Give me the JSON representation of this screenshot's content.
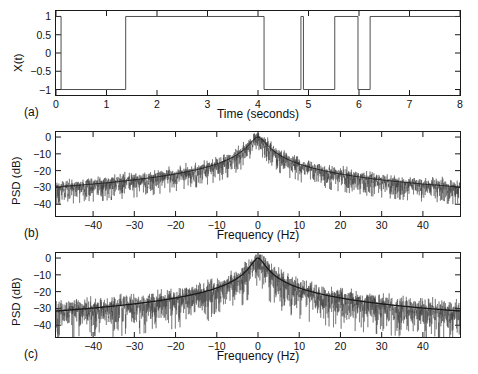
{
  "figure": {
    "width": 478,
    "height": 374,
    "background": "#ffffff",
    "line_color": "#1a1a1a",
    "trace_color": "#3a3a3a"
  },
  "chart_data": [
    {
      "type": "line",
      "panel_label": "(a)",
      "title": "",
      "xlabel": "Time (seconds)",
      "ylabel": "X(t)",
      "xlim": [
        0,
        8
      ],
      "ylim": [
        -1.15,
        1.15
      ],
      "xticks": [
        0,
        1,
        2,
        3,
        4,
        5,
        6,
        7,
        8
      ],
      "xticklabels": [
        "0",
        "1",
        "2",
        "3",
        "4",
        "5",
        "6",
        "7",
        "8"
      ],
      "yticks": [
        -1,
        -0.5,
        0,
        0.5,
        1
      ],
      "yticklabels": [
        "-1",
        "-0.5",
        "0",
        "0.5",
        "1"
      ],
      "grid": false,
      "legend": "none",
      "description": "Random telegraph / binary switching signal alternating between +1 and -1",
      "switch_times": [
        0.0,
        0.1,
        1.38,
        4.12,
        4.85,
        4.9,
        5.52,
        5.98,
        6.22,
        8.0
      ],
      "levels": [
        1,
        -1,
        1,
        -1,
        1,
        -1,
        1,
        -1,
        1
      ],
      "x": [
        0,
        0.1,
        1.38,
        4.12,
        4.85,
        4.9,
        5.52,
        5.98,
        6.22,
        8
      ],
      "y": [
        1,
        -1,
        1,
        -1,
        1,
        -1,
        1,
        -1,
        1,
        1
      ]
    },
    {
      "type": "line",
      "panel_label": "(b)",
      "title": "",
      "xlabel": "Frequency (Hz)",
      "ylabel": "PSD (dB)",
      "xlim": [
        -49,
        49
      ],
      "ylim": [
        -47,
        3
      ],
      "xticks": [
        -40,
        -30,
        -20,
        -10,
        0,
        10,
        20,
        30,
        40
      ],
      "xticklabels": [
        "-40",
        "-30",
        "-20",
        "-10",
        "0",
        "10",
        "20",
        "30",
        "40"
      ],
      "yticks": [
        -40,
        -30,
        -20,
        -10,
        0
      ],
      "yticklabels": [
        "-40",
        "-30",
        "-20",
        "-10",
        "0"
      ],
      "grid": false,
      "legend": "none",
      "description": "Power spectral density with scalloped periodic sidelobe structure plus smooth theoretical Lorentzian envelope",
      "series": [
        {
          "name": "estimated-psd",
          "style": "noisy"
        },
        {
          "name": "theoretical-envelope",
          "style": "smooth"
        }
      ],
      "peak_db": 0,
      "noise_floor_db": -45,
      "sidelobe_level_db": -30,
      "sidelobe_spacing_hz": 5.2,
      "envelope_half_width_hz": 1.6
    },
    {
      "type": "line",
      "panel_label": "(c)",
      "title": "",
      "xlabel": "Frequency (Hz)",
      "ylabel": "PSD (dB)",
      "xlim": [
        -49,
        49
      ],
      "ylim": [
        -47,
        3
      ],
      "xticks": [
        -40,
        -30,
        -20,
        -10,
        0,
        10,
        20,
        30,
        40
      ],
      "xticklabels": [
        "-40",
        "-30",
        "-20",
        "-10",
        "0",
        "10",
        "20",
        "30",
        "40"
      ],
      "yticks": [
        -40,
        -30,
        -20,
        -10,
        0
      ],
      "yticklabels": [
        "-40",
        "-30",
        "-20",
        "-10",
        "0"
      ],
      "grid": false,
      "legend": "none",
      "description": "Power spectral density of random telegraph signal: noisy periodogram with smooth Lorentzian envelope, no scalloping",
      "series": [
        {
          "name": "estimated-psd",
          "style": "noisy"
        },
        {
          "name": "theoretical-envelope",
          "style": "smooth"
        }
      ],
      "peak_db": 0,
      "noise_floor_db": -43,
      "envelope_half_width_hz": 1.3
    }
  ]
}
